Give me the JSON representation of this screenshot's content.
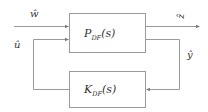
{
  "diagram": {
    "type": "feedback-block-diagram",
    "blocks": [
      {
        "id": "plant",
        "main": "P",
        "sub": "DF",
        "arg": "(s)"
      },
      {
        "id": "controller",
        "main": "K",
        "sub": "DF",
        "arg": "(s)"
      }
    ],
    "signals": {
      "w": "ŵ",
      "z": "ẑ",
      "u": "û",
      "y": "ŷ"
    },
    "colors": {
      "line": "#9a9a9a",
      "text": "#333333",
      "background": "#ffffff"
    }
  }
}
